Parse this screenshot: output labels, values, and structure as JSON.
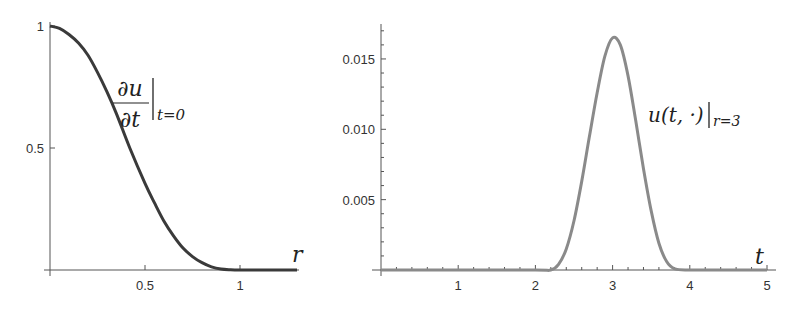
{
  "chart_data": [
    {
      "type": "line",
      "title": "",
      "annotation": {
        "numerator": "∂u",
        "denominator": "∂t",
        "subscript": "t=0"
      },
      "xlabel": "r",
      "ylabel": "",
      "xlim": [
        0,
        1.3
      ],
      "ylim": [
        0,
        1
      ],
      "x_ticks": [
        0.5,
        1
      ],
      "x_tick_labels": [
        "0.5",
        "1"
      ],
      "y_ticks": [
        0.5,
        1
      ],
      "y_tick_labels": [
        "0.5",
        "1"
      ],
      "grid": false,
      "series": [
        {
          "name": "du/dt at t=0",
          "color": "#3a3a3a",
          "x": [
            0,
            0.05,
            0.1,
            0.15,
            0.2,
            0.25,
            0.3,
            0.35,
            0.42,
            0.5,
            0.55,
            0.6,
            0.65,
            0.7,
            0.75,
            0.8,
            0.85,
            0.9,
            0.95,
            1.0,
            1.1,
            1.2,
            1.3
          ],
          "y": [
            1,
            0.99,
            0.965,
            0.93,
            0.88,
            0.81,
            0.73,
            0.64,
            0.5,
            0.355,
            0.275,
            0.2,
            0.14,
            0.09,
            0.055,
            0.03,
            0.013,
            0.004,
            0.001,
            0,
            0,
            0,
            0
          ]
        }
      ]
    },
    {
      "type": "line",
      "title": "",
      "annotation": {
        "main": "u(t, ·)",
        "subscript": "r=3"
      },
      "xlabel": "t",
      "ylabel": "",
      "xlim": [
        0,
        5
      ],
      "ylim": [
        0,
        0.0175
      ],
      "x_ticks": [
        1,
        2,
        3,
        4,
        5
      ],
      "x_tick_labels": [
        "1",
        "2",
        "3",
        "4",
        "5"
      ],
      "y_ticks": [
        0.005,
        0.01,
        0.015
      ],
      "y_tick_labels": [
        "0.005",
        "0.010",
        "0.015"
      ],
      "grid": false,
      "series": [
        {
          "name": "u(t,·) at r=3",
          "color": "#8a8a8a",
          "x": [
            0,
            1,
            2,
            2.2,
            2.3,
            2.4,
            2.5,
            2.6,
            2.7,
            2.8,
            2.9,
            3.0,
            3.1,
            3.2,
            3.3,
            3.4,
            3.5,
            3.6,
            3.7,
            3.8,
            4.0,
            5.0
          ],
          "y": [
            0,
            0,
            0,
            0,
            0.0004,
            0.0015,
            0.0035,
            0.0063,
            0.0095,
            0.0126,
            0.0152,
            0.0165,
            0.016,
            0.0138,
            0.0106,
            0.0072,
            0.0042,
            0.0019,
            0.0006,
            0.0001,
            0,
            0
          ]
        }
      ]
    }
  ]
}
